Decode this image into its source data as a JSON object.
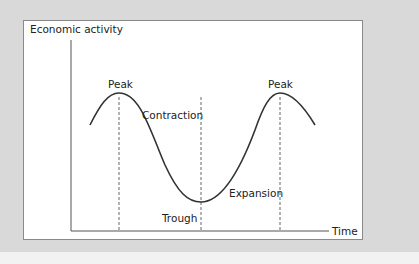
{
  "diagram": {
    "y_axis_label": "Economic activity",
    "x_axis_label": "Time",
    "labels": {
      "peak_left": "Peak",
      "peak_right": "Peak",
      "contraction": "Contraction",
      "expansion": "Expansion",
      "trough": "Trough"
    },
    "colors": {
      "background": "#d9d9d9",
      "panel": "#ffffff",
      "curve": "#333333",
      "dashed": "#666666",
      "axis": "#555555"
    }
  }
}
